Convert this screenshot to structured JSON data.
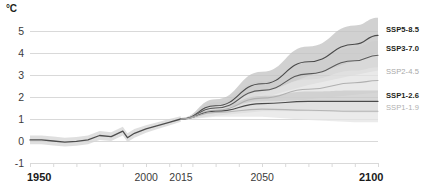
{
  "chart_data": {
    "type": "line",
    "title": "",
    "subtitle": "",
    "xlabel": "",
    "ylabel": "°C",
    "unit_label": "°C",
    "xlim": [
      1950,
      2100
    ],
    "ylim": [
      -1,
      5
    ],
    "yticks": [
      5,
      4,
      3,
      2,
      1,
      0,
      -1
    ],
    "ytick_labels": [
      "5",
      "4",
      "3",
      "2",
      "1",
      "0",
      "-1"
    ],
    "xticks": [
      1950,
      2000,
      2015,
      2050,
      2100
    ],
    "xtick_labels": [
      "1950",
      "2000",
      "2015",
      "2050",
      "2100"
    ],
    "minor_xticks": [
      1960,
      1970,
      1980,
      1990,
      2010,
      2020,
      2030,
      2040,
      2060,
      2070,
      2080,
      2090
    ],
    "grid": "horizontal",
    "legend_position": "right-outside",
    "branch_year": 2015,
    "historical": {
      "name": "historical",
      "color": "#4d4d4d",
      "band_color": "#d4d4d4",
      "x": [
        1950,
        1955,
        1960,
        1965,
        1970,
        1975,
        1980,
        1985,
        1990,
        1992,
        1995,
        2000,
        2005,
        2010,
        2015
      ],
      "values": [
        0.05,
        0.05,
        0.0,
        -0.05,
        -0.02,
        0.05,
        0.25,
        0.2,
        0.45,
        0.15,
        0.35,
        0.55,
        0.7,
        0.85,
        1.0
      ],
      "band_low": [
        -0.15,
        -0.15,
        -0.2,
        -0.25,
        -0.22,
        -0.15,
        0.05,
        0.0,
        0.25,
        -0.05,
        0.15,
        0.38,
        0.55,
        0.7,
        0.88
      ],
      "band_high": [
        0.25,
        0.25,
        0.2,
        0.15,
        0.18,
        0.25,
        0.45,
        0.4,
        0.65,
        0.35,
        0.55,
        0.72,
        0.85,
        1.0,
        1.12
      ]
    },
    "series": [
      {
        "name": "SSP5-8.5",
        "label": "SSP5-8.5",
        "line_color": "#4a4a4a",
        "band_color": "#c2c2c2",
        "label_color": "#231f20",
        "label_weight": "700",
        "x": [
          2015,
          2030,
          2050,
          2070,
          2090,
          2100
        ],
        "values": [
          1.0,
          1.6,
          2.6,
          3.6,
          4.4,
          4.8
        ],
        "band_low": [
          0.95,
          1.35,
          2.15,
          2.95,
          3.65,
          4.0
        ],
        "band_high": [
          1.05,
          1.9,
          3.15,
          4.3,
          5.25,
          5.6
        ],
        "endpoint_value": 4.8
      },
      {
        "name": "SSP3-7.0",
        "label": "SSP3-7.0",
        "line_color": "#5a5a5a",
        "band_color": "#cccccc",
        "label_color": "#231f20",
        "label_weight": "700",
        "x": [
          2015,
          2030,
          2050,
          2070,
          2090,
          2100
        ],
        "values": [
          1.0,
          1.5,
          2.3,
          3.05,
          3.65,
          3.9
        ],
        "band_low": [
          0.95,
          1.3,
          1.95,
          2.55,
          3.0,
          3.2
        ],
        "band_high": [
          1.05,
          1.75,
          2.7,
          3.55,
          4.25,
          4.55
        ],
        "endpoint_value": 3.9
      },
      {
        "name": "SSP2-4.5",
        "label": "SSP2-4.5",
        "line_color": "#b0b0b0",
        "band_color": "#e2e2e2",
        "label_color": "#a8a8a8",
        "label_weight": "400",
        "x": [
          2015,
          2030,
          2050,
          2070,
          2090,
          2100
        ],
        "values": [
          1.0,
          1.4,
          1.95,
          2.35,
          2.65,
          2.75
        ],
        "band_low": [
          0.95,
          1.2,
          1.6,
          1.9,
          2.1,
          2.2
        ],
        "band_high": [
          1.05,
          1.6,
          2.3,
          2.8,
          3.2,
          3.35
        ],
        "endpoint_value": 2.75
      },
      {
        "name": "SSP1-2.6",
        "label": "SSP1-2.6",
        "line_color": "#4a4a4a",
        "band_color": "#c8c8c8",
        "label_color": "#231f20",
        "label_weight": "700",
        "x": [
          2015,
          2030,
          2050,
          2070,
          2090,
          2100
        ],
        "values": [
          1.0,
          1.35,
          1.7,
          1.8,
          1.8,
          1.8
        ],
        "band_low": [
          0.95,
          1.15,
          1.35,
          1.35,
          1.3,
          1.3
        ],
        "band_high": [
          1.05,
          1.55,
          2.05,
          2.25,
          2.3,
          2.3
        ],
        "endpoint_value": 1.8
      },
      {
        "name": "SSP1-1.9",
        "label": "SSP1-1.9",
        "line_color": "#b5b5b5",
        "band_color": "#e4e4e4",
        "label_color": "#b0b0b0",
        "label_weight": "400",
        "x": [
          2015,
          2030,
          2050,
          2070,
          2090,
          2100
        ],
        "values": [
          1.0,
          1.3,
          1.45,
          1.4,
          1.35,
          1.35
        ],
        "band_low": [
          0.95,
          1.1,
          1.1,
          0.95,
          0.85,
          0.85
        ],
        "band_high": [
          1.05,
          1.5,
          1.8,
          1.85,
          1.85,
          1.85
        ],
        "endpoint_value": 1.35
      }
    ]
  },
  "colors": {
    "grid": "#d9d9d9",
    "axis_text": "#3b3b3b",
    "axis_text_bold": "#1a1a1a",
    "background": "#ffffff"
  }
}
